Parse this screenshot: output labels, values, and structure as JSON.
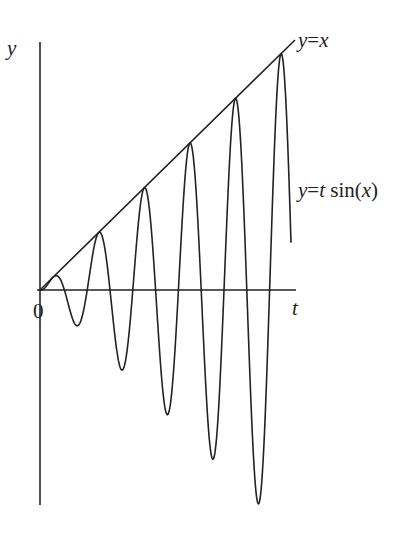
{
  "chart_data": {
    "type": "line",
    "title": "",
    "xlabel": "t",
    "ylabel": "y",
    "origin_label": "0",
    "grid": false,
    "legend": "none",
    "series": [
      {
        "name": "y=x",
        "kind": "line",
        "label_parts": [
          "y",
          "=",
          "x"
        ]
      },
      {
        "name": "y=t sin(x)",
        "kind": "oscillation",
        "label_parts": [
          "y",
          "=",
          "t",
          " sin(",
          "x",
          ")"
        ],
        "description": "oscillation with linearly growing amplitude bounded above by y=x",
        "approx_peaks_count": 6,
        "approx_troughs_count": 5
      }
    ]
  },
  "labels": {
    "y_axis": "y",
    "t_axis": "t",
    "origin": "0",
    "line_label": {
      "a": "y",
      "eq": "=",
      "b": "x"
    },
    "curve_label": {
      "a": "y",
      "eq": "=",
      "b": "t",
      "c": " sin(",
      "d": "x",
      "e": ")"
    }
  },
  "geometry": {
    "origin": [
      40,
      290
    ],
    "y_axis": {
      "top": 42,
      "bottom": 505
    },
    "t_axis": {
      "left": 37,
      "right": 296
    },
    "line_end": [
      295,
      40
    ],
    "slope": 0.98,
    "period_px": 45.6,
    "phase_x": 41.6,
    "curve_end_x": 291,
    "stroke": "#222222"
  }
}
